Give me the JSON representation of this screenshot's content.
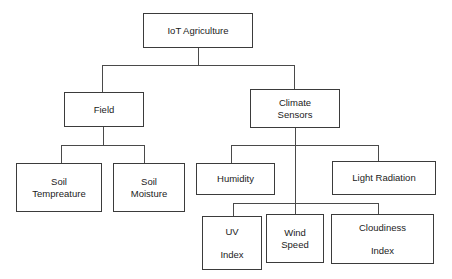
{
  "diagram": {
    "title": "IoT Agriculture",
    "type": "hierarchy-tree",
    "background_color": "#ffffff",
    "box_border_color": "#3b3b3b",
    "connector_color": "#4a4a4a",
    "text_color": "#1b1b1b",
    "nodes": [
      {
        "id": "root",
        "label": "IoT Agriculture",
        "lines": [
          "IoT Agriculture"
        ],
        "level": 0,
        "x": 143,
        "y": 13,
        "w": 110,
        "h": 35,
        "extra_line_gap": false
      },
      {
        "id": "field",
        "label": "Field",
        "lines": [
          "Field"
        ],
        "level": 1,
        "x": 64,
        "y": 92,
        "w": 80,
        "h": 35,
        "extra_line_gap": false
      },
      {
        "id": "climate-sensors",
        "label": "Climate Sensors",
        "lines": [
          "Climate",
          "Sensors"
        ],
        "level": 1,
        "x": 250,
        "y": 89,
        "w": 90,
        "h": 39,
        "extra_line_gap": false
      },
      {
        "id": "soil-tempreature",
        "label": "Soil Tempreature",
        "lines": [
          "Soil",
          "Tempreature"
        ],
        "level": 2,
        "x": 16,
        "y": 163,
        "w": 86,
        "h": 49,
        "extra_line_gap": false
      },
      {
        "id": "soil-moisture",
        "label": "Soil Moisture",
        "lines": [
          "Soil",
          "Moisture"
        ],
        "level": 2,
        "x": 113,
        "y": 163,
        "w": 72,
        "h": 49,
        "extra_line_gap": false
      },
      {
        "id": "humidity",
        "label": "Humidity",
        "lines": [
          "Humidity"
        ],
        "level": 2,
        "x": 196,
        "y": 163,
        "w": 79,
        "h": 32,
        "extra_line_gap": false
      },
      {
        "id": "light-radiation",
        "label": "Light Radiation",
        "lines": [
          "Light Radiation"
        ],
        "level": 2,
        "x": 332,
        "y": 161,
        "w": 104,
        "h": 34,
        "extra_line_gap": false
      },
      {
        "id": "uv-index",
        "label": "UV Index",
        "lines": [
          "UV",
          "Index"
        ],
        "level": 3,
        "x": 202,
        "y": 216,
        "w": 60,
        "h": 54,
        "extra_line_gap": true
      },
      {
        "id": "wind-speed",
        "label": "Wind Speed",
        "lines": [
          "Wind",
          "Speed"
        ],
        "level": 3,
        "x": 266,
        "y": 214,
        "w": 58,
        "h": 49,
        "extra_line_gap": false
      },
      {
        "id": "cloudiness-index",
        "label": "Cloudiness Index",
        "lines": [
          "Cloudiness",
          "Index"
        ],
        "level": 3,
        "x": 331,
        "y": 214,
        "w": 103,
        "h": 50,
        "extra_line_gap": true
      }
    ],
    "edges": [
      {
        "from": "root",
        "to": "field"
      },
      {
        "from": "root",
        "to": "climate-sensors"
      },
      {
        "from": "field",
        "to": "soil-tempreature"
      },
      {
        "from": "field",
        "to": "soil-moisture"
      },
      {
        "from": "climate-sensors",
        "to": "humidity"
      },
      {
        "from": "climate-sensors",
        "to": "light-radiation"
      },
      {
        "from": "climate-sensors",
        "to": "uv-index"
      },
      {
        "from": "climate-sensors",
        "to": "wind-speed"
      },
      {
        "from": "climate-sensors",
        "to": "cloudiness-index"
      }
    ],
    "connector_paths": [
      "M198,48 L198,65",
      "M102,65 L294,65",
      "M102,65 L102,92",
      "M294,65 L294,89",
      "M103,127 L103,145",
      "M61,145 L144,145",
      "M61,145 L61,163",
      "M144,145 L144,163",
      "M295,128 L295,203",
      "M231,145 L378,145",
      "M231,145 L231,163",
      "M378,145 L378,161",
      "M233,203 L378,203",
      "M233,203 L233,216",
      "M378,203 L378,214",
      "M295,203 L295,214"
    ]
  }
}
